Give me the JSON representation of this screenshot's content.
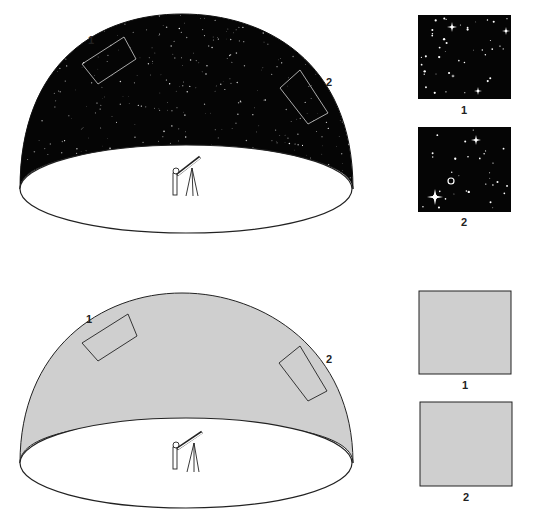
{
  "panels": [
    {
      "id": "top",
      "sky": "starry",
      "dome_fill": "#050505",
      "region_labels": [
        "1",
        "2"
      ],
      "insets": [
        {
          "label": "1",
          "content": "stars-and-galaxies"
        },
        {
          "label": "2",
          "content": "stars-and-galaxies-with-spiral"
        }
      ]
    },
    {
      "id": "bottom",
      "sky": "uniform",
      "dome_fill": "#cfcfcf",
      "region_labels": [
        "1",
        "2"
      ],
      "insets": [
        {
          "label": "1",
          "content": "uniform-gray"
        },
        {
          "label": "2",
          "content": "uniform-gray"
        }
      ]
    }
  ],
  "colors": {
    "dark_sky": "#050505",
    "gray_sky": "#cfcfcf",
    "outline": "#222222",
    "region_outline_dark": "#bbbbbb"
  }
}
